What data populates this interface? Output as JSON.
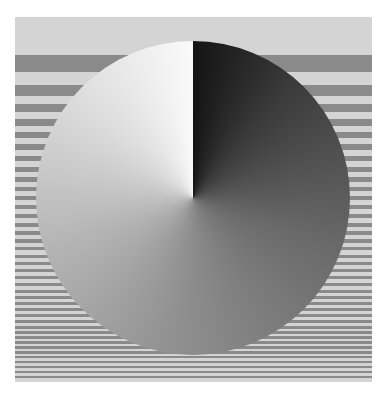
{
  "figure": {
    "kind": "optical-illusion",
    "frame": {
      "x": 15,
      "y": 17,
      "width": 357,
      "height": 365
    },
    "colors": {
      "background": "#ffffff",
      "frame_light": "#d4d4d4",
      "stripe_dark": "#8a8a8a",
      "disc_white": "#fafafa",
      "disc_black": "#141414",
      "disc_mid": "#8c8c8c"
    },
    "disc": {
      "cx": 193,
      "cy": 198,
      "r": 157
    },
    "stripes": [
      [
        55,
        17
      ],
      [
        85,
        11
      ],
      [
        104,
        8
      ],
      [
        119,
        7
      ],
      [
        132,
        6
      ],
      [
        144,
        6
      ],
      [
        156,
        5
      ],
      [
        167,
        5
      ],
      [
        177,
        5
      ],
      [
        187,
        4
      ],
      [
        196,
        4
      ],
      [
        205,
        4
      ],
      [
        214,
        4
      ],
      [
        223,
        4
      ],
      [
        231,
        4
      ],
      [
        239,
        4
      ],
      [
        247,
        3
      ],
      [
        255,
        3
      ],
      [
        262,
        3
      ],
      [
        269,
        3
      ],
      [
        276,
        3
      ],
      [
        283,
        3
      ],
      [
        290,
        3
      ],
      [
        296,
        3
      ],
      [
        302,
        3
      ],
      [
        308,
        3
      ],
      [
        314,
        3
      ],
      [
        320,
        3
      ],
      [
        326,
        3
      ],
      [
        331,
        3
      ],
      [
        336,
        3
      ],
      [
        341,
        3
      ],
      [
        346,
        3
      ],
      [
        351,
        3
      ],
      [
        356,
        2
      ],
      [
        361,
        2
      ],
      [
        366,
        2
      ],
      [
        371,
        2
      ],
      [
        376,
        2
      ]
    ]
  }
}
